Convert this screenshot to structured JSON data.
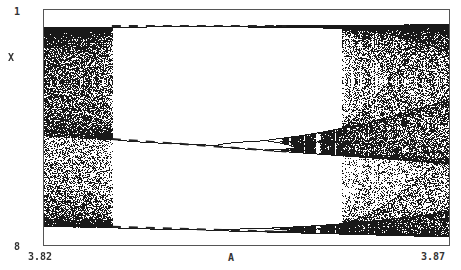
{
  "chart_data": {
    "type": "scatter",
    "title": "",
    "subtitle": "Bifurcation diagram of logistic map x -> A*x*(1-x), period-3 window",
    "xlabel": "A",
    "ylabel": "X",
    "xlim": [
      3.82,
      3.87
    ],
    "ylim": [
      0,
      1
    ],
    "xticks": [
      "3.82",
      "3.87"
    ],
    "yticks": [
      "0",
      "1"
    ],
    "ytick_display": [
      "8",
      "1"
    ],
    "grid": false,
    "legend": null,
    "map": "logistic",
    "series": [
      {
        "name": "attractor points",
        "style": "dots",
        "color": "#1a1a1a"
      },
      {
        "name": "unstable period-3 orbit",
        "style": "dashed",
        "color": "#222222",
        "x_range": [
          3.8284,
          3.87
        ],
        "approx_points": [
          {
            "A": 3.8284,
            "x": [
              0.16,
              0.51,
              0.96
            ]
          },
          {
            "A": 3.85,
            "x": [
              0.14,
              0.46,
              0.96
            ]
          }
        ]
      }
    ],
    "annotations": [
      {
        "text": "period-3 window onset (tangent bifurcation)",
        "A": 3.8284
      },
      {
        "text": "period-doubling cascade then crisis",
        "A": 3.857
      }
    ]
  },
  "axes": {
    "y_top": "1",
    "y_label": "X",
    "y_bottom": "8",
    "x_left": "3.82",
    "x_label": "A",
    "x_right": "3.87"
  }
}
